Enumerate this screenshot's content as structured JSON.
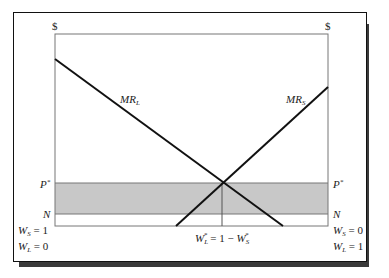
{
  "diagram": {
    "axis_labels": {
      "left_top": "$",
      "right_top": "$"
    },
    "curves": [
      {
        "id": "mr-l",
        "label": "MR",
        "subscript": "L",
        "slope": "downward"
      },
      {
        "id": "mr-s",
        "label": "MR",
        "subscript": "S",
        "slope": "upward"
      }
    ],
    "levels": {
      "p_star": {
        "label": "P",
        "sup": "*"
      },
      "n": {
        "label": "N"
      }
    },
    "shaded_band": {
      "from": "N",
      "to": "P*",
      "color": "#c8c8c8"
    },
    "left_corner": {
      "line1": "W",
      "line1_sub": "S",
      "line1_val": " = 1",
      "line2": "W",
      "line2_sub": "L",
      "line2_val": " = 0"
    },
    "right_corner": {
      "line1": "W",
      "line1_sub": "S",
      "line1_val": " = 0",
      "line2": "W",
      "line2_sub": "L",
      "line2_val": " = 1"
    },
    "equilibrium_label": {
      "a": "W",
      "a_sub": "L",
      "a_sup": "*",
      "mid": " = 1 − ",
      "b": "W",
      "b_sub": "S",
      "b_sup": "*"
    }
  }
}
